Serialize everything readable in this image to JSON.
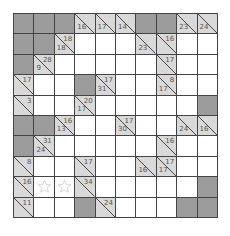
{
  "puzzle": {
    "type": "kakuro",
    "rows": 10,
    "cols": 10,
    "colors": {
      "dark": "#9c9c9c",
      "clue": "#d9d9d9",
      "white": "#ffffff",
      "grid_line": "#444444"
    },
    "cells": [
      [
        {
          "t": "dark"
        },
        {
          "t": "dark"
        },
        {
          "t": "dark"
        },
        {
          "t": "clue",
          "down": "16"
        },
        {
          "t": "clue",
          "down": "17"
        },
        {
          "t": "clue",
          "down": "14"
        },
        {
          "t": "dark"
        },
        {
          "t": "dark"
        },
        {
          "t": "clue",
          "down": "23"
        },
        {
          "t": "clue",
          "down": "24"
        }
      ],
      [
        {
          "t": "dark"
        },
        {
          "t": "dark"
        },
        {
          "t": "clue",
          "right": "18",
          "down": "18"
        },
        {
          "t": "white"
        },
        {
          "t": "white"
        },
        {
          "t": "white"
        },
        {
          "t": "clue",
          "down": "23"
        },
        {
          "t": "clue",
          "right": "16"
        },
        {
          "t": "white"
        },
        {
          "t": "white"
        }
      ],
      [
        {
          "t": "dark"
        },
        {
          "t": "clue",
          "right": "28",
          "down": "9"
        },
        {
          "t": "white"
        },
        {
          "t": "white"
        },
        {
          "t": "white"
        },
        {
          "t": "white"
        },
        {
          "t": "white"
        },
        {
          "t": "clue",
          "right": "17"
        },
        {
          "t": "white"
        },
        {
          "t": "white"
        }
      ],
      [
        {
          "t": "clue",
          "right": "17"
        },
        {
          "t": "white"
        },
        {
          "t": "white"
        },
        {
          "t": "dark"
        },
        {
          "t": "clue",
          "right": "17",
          "down": "31"
        },
        {
          "t": "white"
        },
        {
          "t": "white"
        },
        {
          "t": "clue",
          "right": "8",
          "down": "17"
        },
        {
          "t": "white"
        },
        {
          "t": "white"
        }
      ],
      [
        {
          "t": "clue",
          "right": "3"
        },
        {
          "t": "white"
        },
        {
          "t": "white"
        },
        {
          "t": "clue",
          "right": "20",
          "down": "17"
        },
        {
          "t": "white"
        },
        {
          "t": "white"
        },
        {
          "t": "white"
        },
        {
          "t": "white"
        },
        {
          "t": "white"
        },
        {
          "t": "dark"
        }
      ],
      [
        {
          "t": "dark"
        },
        {
          "t": "dark"
        },
        {
          "t": "clue",
          "right": "16",
          "down": "13"
        },
        {
          "t": "white"
        },
        {
          "t": "white"
        },
        {
          "t": "clue",
          "right": "17",
          "down": "30"
        },
        {
          "t": "white"
        },
        {
          "t": "white"
        },
        {
          "t": "clue",
          "down": "24"
        },
        {
          "t": "clue",
          "down": "16"
        }
      ],
      [
        {
          "t": "dark"
        },
        {
          "t": "clue",
          "right": "31",
          "down": "24"
        },
        {
          "t": "white"
        },
        {
          "t": "white"
        },
        {
          "t": "white"
        },
        {
          "t": "white"
        },
        {
          "t": "white"
        },
        {
          "t": "clue",
          "right": "16"
        },
        {
          "t": "white"
        },
        {
          "t": "white"
        }
      ],
      [
        {
          "t": "clue",
          "right": "8"
        },
        {
          "t": "white"
        },
        {
          "t": "white"
        },
        {
          "t": "clue",
          "right": "17"
        },
        {
          "t": "white"
        },
        {
          "t": "white"
        },
        {
          "t": "clue",
          "down": "16"
        },
        {
          "t": "clue",
          "right": "17",
          "down": "17"
        },
        {
          "t": "white"
        },
        {
          "t": "white"
        }
      ],
      [
        {
          "t": "clue",
          "right": "16"
        },
        {
          "t": "white",
          "mark": "star"
        },
        {
          "t": "white",
          "mark": "star"
        },
        {
          "t": "clue",
          "right": "34"
        },
        {
          "t": "white"
        },
        {
          "t": "white"
        },
        {
          "t": "white"
        },
        {
          "t": "white"
        },
        {
          "t": "white"
        },
        {
          "t": "dark"
        }
      ],
      [
        {
          "t": "clue",
          "right": "11"
        },
        {
          "t": "white"
        },
        {
          "t": "white"
        },
        {
          "t": "dark"
        },
        {
          "t": "clue",
          "right": "24"
        },
        {
          "t": "white"
        },
        {
          "t": "white"
        },
        {
          "t": "white"
        },
        {
          "t": "dark"
        },
        {
          "t": "dark"
        }
      ]
    ]
  }
}
